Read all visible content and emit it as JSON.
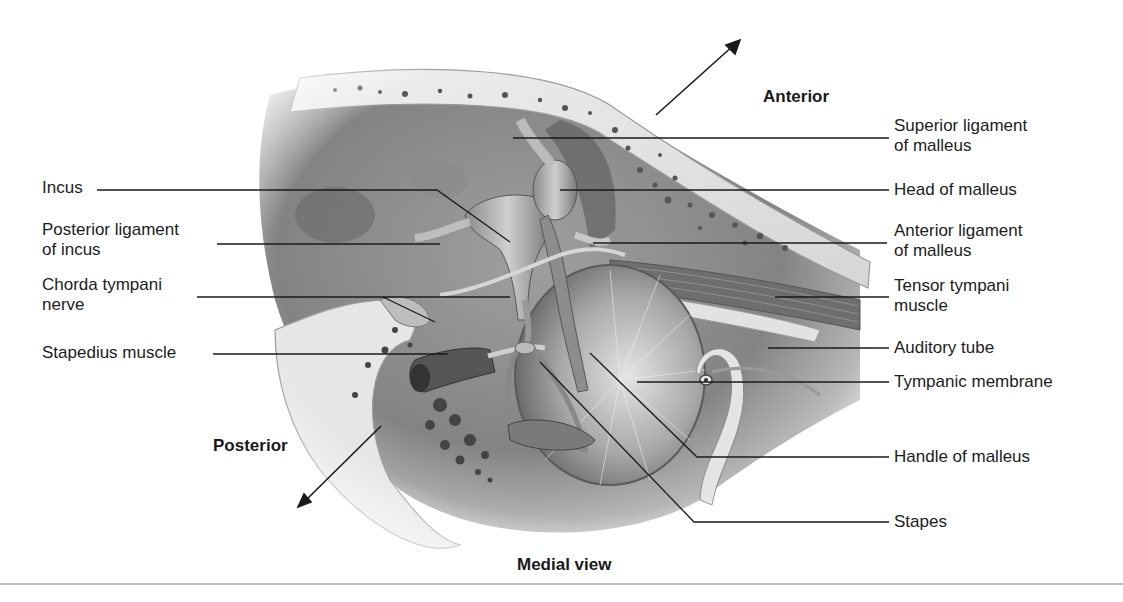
{
  "figure": {
    "caption": "Medial view",
    "orientation": {
      "anterior": "Anterior",
      "posterior": "Posterior"
    },
    "labels_left": [
      {
        "id": "incus",
        "lines": [
          "Incus"
        ]
      },
      {
        "id": "posterior-ligament-of-incus",
        "lines": [
          "Posterior ligament",
          "of incus"
        ]
      },
      {
        "id": "chorda-tympani-nerve",
        "lines": [
          "Chorda tympani",
          "nerve"
        ]
      },
      {
        "id": "stapedius-muscle",
        "lines": [
          "Stapedius muscle"
        ]
      }
    ],
    "labels_right": [
      {
        "id": "superior-ligament-of-malleus",
        "lines": [
          "Superior ligament",
          "of malleus"
        ]
      },
      {
        "id": "head-of-malleus",
        "lines": [
          "Head of malleus"
        ]
      },
      {
        "id": "anterior-ligament-of-malleus",
        "lines": [
          "Anterior ligament",
          "of malleus"
        ]
      },
      {
        "id": "tensor-tympani-muscle",
        "lines": [
          "Tensor tympani",
          "muscle"
        ]
      },
      {
        "id": "auditory-tube",
        "lines": [
          "Auditory tube"
        ]
      },
      {
        "id": "tympanic-membrane",
        "lines": [
          "Tympanic membrane"
        ]
      },
      {
        "id": "handle-of-malleus",
        "lines": [
          "Handle of malleus"
        ]
      },
      {
        "id": "stapes",
        "lines": [
          "Stapes"
        ]
      }
    ],
    "colors": {
      "ink": "#1a1a1a",
      "bone": "#e6e6e6",
      "cavity": "#7a7a7a",
      "rule": "#bdbdbd"
    }
  }
}
